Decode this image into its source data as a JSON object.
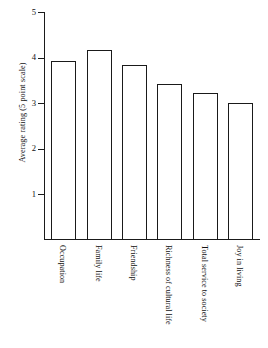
{
  "chart_data": {
    "type": "bar",
    "title": "",
    "xlabel": "",
    "ylabel": "Average rating (5 point scale)",
    "ylim": [
      0,
      5
    ],
    "yticks": [
      1,
      2,
      3,
      4,
      5
    ],
    "ytick_labels": [
      "1",
      "2",
      "3",
      "4",
      "5"
    ],
    "grid": false,
    "legend": false,
    "bar_style": {
      "fill": "#ffffff",
      "edge": "#1a1a1a"
    },
    "categories": [
      "Occupation",
      "Family life",
      "Friendship",
      "Richness of cultural life",
      "Total service to society",
      "Joy in living"
    ],
    "values": [
      3.93,
      4.17,
      3.83,
      3.42,
      3.22,
      3.0
    ]
  }
}
